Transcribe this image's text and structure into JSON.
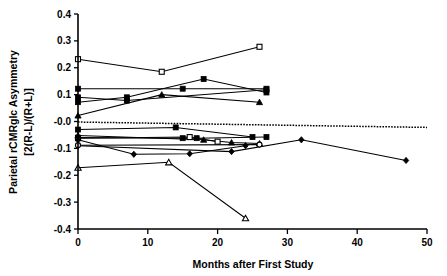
{
  "chart_data": {
    "type": "line",
    "title": "",
    "xlabel": "Months after First Study",
    "ylabel_line1": "Parietal rCMRglc Asymmetry",
    "ylabel_line2": "[2(R-L)/(R+L)]",
    "xlim": [
      0,
      50
    ],
    "ylim": [
      -0.4,
      0.4
    ],
    "xticks": [
      0,
      10,
      20,
      30,
      40,
      50
    ],
    "xticklabels": [
      "0",
      "10",
      "20",
      "30",
      "40",
      "50"
    ],
    "yticks": [
      0.4,
      0.3,
      0.2,
      0.1,
      0.0,
      -0.1,
      -0.2,
      -0.3,
      -0.4
    ],
    "yticklabels": [
      "0.4",
      "0.3",
      "0.2",
      "0.1",
      "-0.0",
      "-0.1",
      "-0.2",
      "-0.3",
      "-0.4"
    ],
    "grid": false,
    "legend": "none",
    "marker_legend": [
      {
        "key": "open-square",
        "shape": "square",
        "filled": false
      },
      {
        "key": "filled-square",
        "shape": "square",
        "filled": true
      },
      {
        "key": "open-triangle",
        "shape": "triangle",
        "filled": false
      },
      {
        "key": "filled-triangle",
        "shape": "triangle",
        "filled": true
      },
      {
        "key": "filled-diamond",
        "shape": "diamond",
        "filled": true
      },
      {
        "key": "open-circle",
        "shape": "circle",
        "filled": false
      }
    ],
    "series": [
      {
        "name": "subject-1",
        "marker": "open-square",
        "x": [
          0,
          12,
          26
        ],
        "values": [
          0.232,
          0.185,
          0.278
        ]
      },
      {
        "name": "subject-2",
        "marker": "filled-square",
        "x": [
          0,
          7,
          18,
          27
        ],
        "values": [
          0.072,
          0.09,
          0.158,
          0.108
        ]
      },
      {
        "name": "subject-3",
        "marker": "filled-square",
        "x": [
          0,
          15,
          27
        ],
        "values": [
          0.122,
          0.122,
          0.122
        ]
      },
      {
        "name": "subject-4",
        "marker": "filled-square",
        "x": [
          0,
          7,
          27
        ],
        "values": [
          0.09,
          0.078,
          0.118
        ]
      },
      {
        "name": "subject-5",
        "marker": "filled-triangle",
        "x": [
          0,
          12,
          26
        ],
        "values": [
          0.022,
          0.1,
          0.072
        ]
      },
      {
        "name": "subject-6",
        "marker": "filled-square",
        "x": [
          0,
          14,
          25
        ],
        "values": [
          -0.03,
          -0.022,
          -0.058
        ]
      },
      {
        "name": "subject-7",
        "marker": "filled-square",
        "x": [
          0,
          15,
          17,
          27
        ],
        "values": [
          -0.06,
          -0.062,
          -0.062,
          -0.058
        ]
      },
      {
        "name": "subject-8",
        "marker": "open-square",
        "x": [
          0,
          16,
          20
        ],
        "values": [
          -0.062,
          -0.058,
          -0.075
        ]
      },
      {
        "name": "subject-9",
        "marker": "filled-triangle",
        "x": [
          0,
          18,
          22,
          26
        ],
        "values": [
          -0.052,
          -0.068,
          -0.078,
          -0.082
        ]
      },
      {
        "name": "subject-10",
        "marker": "filled-diamond",
        "x": [
          0,
          22,
          32,
          47
        ],
        "values": [
          -0.09,
          -0.112,
          -0.068,
          -0.145
        ]
      },
      {
        "name": "subject-11",
        "marker": "filled-diamond",
        "x": [
          0,
          8,
          16,
          24
        ],
        "values": [
          -0.068,
          -0.122,
          -0.12,
          -0.09
        ]
      },
      {
        "name": "subject-12",
        "marker": "open-circle",
        "x": [
          0,
          26
        ],
        "values": [
          -0.088,
          -0.086
        ]
      },
      {
        "name": "subject-13",
        "marker": "open-triangle",
        "x": [
          0,
          13,
          24
        ],
        "values": [
          -0.172,
          -0.152,
          -0.36
        ]
      }
    ],
    "trend_line": {
      "name": "regression-line",
      "style": "dotted",
      "x": [
        0,
        50
      ],
      "values": [
        -0.002,
        -0.022
      ]
    }
  }
}
